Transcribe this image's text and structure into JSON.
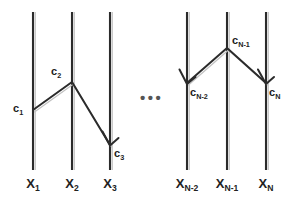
{
  "figure": {
    "type": "worldline-diagram",
    "background_color": "#ffffff",
    "line_color": "#2b2b2b",
    "shadow_color": "#bbbbbb",
    "ellipsis": "•••"
  },
  "axes": [
    {
      "name": "X1",
      "base": "X",
      "sub": "1",
      "x": 33
    },
    {
      "name": "X2",
      "base": "X",
      "sub": "2",
      "x": 72
    },
    {
      "name": "X3",
      "base": "X",
      "sub": "3",
      "x": 110
    },
    {
      "name": "XN-2",
      "base": "X",
      "sub": "N-2",
      "x": 187
    },
    {
      "name": "XN-1",
      "base": "X",
      "sub": "N-1",
      "x": 227
    },
    {
      "name": "XN",
      "base": "X",
      "sub": "N",
      "x": 266
    }
  ],
  "axis_labels": [
    {
      "base": "X",
      "sub": "1"
    },
    {
      "base": "X",
      "sub": "2"
    },
    {
      "base": "X",
      "sub": "3"
    },
    {
      "base": "X",
      "sub": "N-2"
    },
    {
      "base": "X",
      "sub": "N-1"
    },
    {
      "base": "X",
      "sub": "N"
    }
  ],
  "node_labels": [
    {
      "base": "c",
      "sub": "1"
    },
    {
      "base": "c",
      "sub": "2"
    },
    {
      "base": "c",
      "sub": "3"
    },
    {
      "base": "c",
      "sub": "N-2"
    },
    {
      "base": "c",
      "sub": "N-1"
    },
    {
      "base": "c",
      "sub": "N"
    }
  ],
  "edges": [
    {
      "id": "c1-to-c2",
      "from": "c1",
      "to": "c2",
      "arrow_at": "none"
    },
    {
      "id": "c2-to-c3",
      "from": "c2",
      "to": "c3",
      "arrow_at": "c3"
    },
    {
      "id": "cN1-to-cN2",
      "from": "cN-1",
      "to": "cN-2",
      "arrow_at": "cN-2"
    },
    {
      "id": "cN1-to-cN",
      "from": "cN-1",
      "to": "cN",
      "arrow_at": "cN"
    }
  ]
}
